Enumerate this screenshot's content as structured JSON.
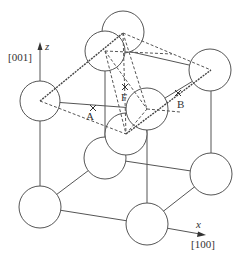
{
  "figure": {
    "axes": {
      "z": {
        "symbol": "z",
        "direction": "[001]"
      },
      "x": {
        "symbol": "x",
        "direction": "[100]"
      }
    },
    "site_labels": {
      "A": "A",
      "B": "B",
      "F": "F"
    },
    "colors": {
      "line": "#555555",
      "atom_fill": "#ffffff",
      "background": "#ffffff"
    }
  }
}
